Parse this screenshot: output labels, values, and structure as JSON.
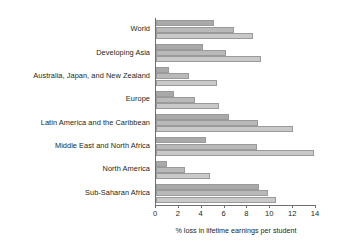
{
  "chart_data": {
    "type": "bar",
    "orientation": "horizontal",
    "title": "",
    "subtitle": "",
    "xlabel": "% loss in lifetime earnings per student",
    "ylabel": "",
    "xlim": [
      0,
      14
    ],
    "xticks": [
      0,
      2,
      4,
      6,
      8,
      10,
      12,
      14
    ],
    "xtick_labels": [
      "0",
      "2",
      "4",
      "6",
      "8",
      "10",
      "12",
      "14"
    ],
    "grid": false,
    "legend": "none",
    "categories": [
      "World",
      "Developing Asia",
      "Australia, Japan, and New Zealand",
      "Europe",
      "Latin America and the Caribbean",
      "Middle East and North Africa",
      "North America",
      "Sub-Saharan Africa"
    ],
    "series": [
      {
        "name": "series-1",
        "color": "#a9a9a9",
        "values": [
          5.1,
          4.1,
          1.1,
          1.6,
          6.4,
          4.4,
          1.0,
          9.0
        ]
      },
      {
        "name": "series-2",
        "color": "#b9b9b9",
        "values": [
          6.8,
          6.1,
          2.9,
          3.4,
          8.9,
          8.8,
          2.5,
          9.8
        ]
      },
      {
        "name": "series-3",
        "color": "#c9c9c9",
        "values": [
          8.5,
          9.2,
          5.3,
          5.5,
          12.0,
          13.8,
          4.7,
          10.5
        ]
      }
    ]
  }
}
